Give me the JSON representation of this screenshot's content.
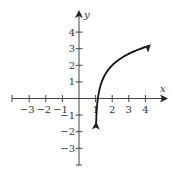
{
  "chart_data": {
    "type": "line",
    "title": "",
    "xlabel": "x",
    "ylabel": "y",
    "xlim": [
      -4,
      5
    ],
    "ylim": [
      -4,
      5
    ],
    "x_ticks": [
      -3,
      -2,
      -1,
      1,
      2,
      3,
      4
    ],
    "y_ticks": [
      4,
      3,
      2,
      1,
      -1,
      -2,
      -3
    ],
    "x_tick_labels": [
      "−3",
      "−2",
      "−1",
      "1",
      "2",
      "3",
      "4"
    ],
    "y_tick_labels": [
      "4",
      "3",
      "2",
      "1",
      "−1",
      "−2",
      "−3"
    ],
    "grid": false,
    "legend": null,
    "series": [
      {
        "name": "curve",
        "description": "logarithmic curve with vertical asymptote near x = 1, arrows at both ends",
        "x": [
          1.14,
          1.2,
          1.3,
          1.5,
          2,
          2.5,
          3,
          3.5,
          4,
          4.2
        ],
        "y": [
          -3.5,
          0.4,
          0.8,
          1.3,
          2.0,
          2.4,
          2.7,
          2.9,
          3.1,
          3.2
        ]
      }
    ]
  }
}
